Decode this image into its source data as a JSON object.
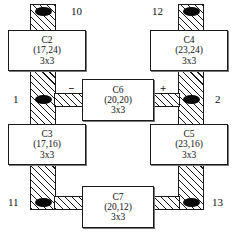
{
  "diagram": {
    "type": "floorplan-schematic",
    "colors": {
      "ink": "#1a1a1a",
      "paper": "#ffffff",
      "node": "#0a0a0a",
      "hatch": "#1a1a1a"
    },
    "cells": [
      {
        "id": "C2",
        "name": "C2",
        "coord": "(17,24)",
        "size": "3x3"
      },
      {
        "id": "C4",
        "name": "C4",
        "coord": "(23,24)",
        "size": "3x3"
      },
      {
        "id": "C6",
        "name": "C6",
        "coord": "(20,20)",
        "size": "3x3"
      },
      {
        "id": "C3",
        "name": "C3",
        "coord": "(17,16)",
        "size": "3x3"
      },
      {
        "id": "C5",
        "name": "C5",
        "coord": "(23,16)",
        "size": "3x3"
      },
      {
        "id": "C7",
        "name": "C7",
        "coord": "(20,12)",
        "size": "3x3"
      }
    ],
    "ports": [
      {
        "id": "p10",
        "label": "10",
        "position": "top-left"
      },
      {
        "id": "p12",
        "label": "12",
        "position": "top-right"
      },
      {
        "id": "p1",
        "label": "1",
        "position": "middle-left"
      },
      {
        "id": "p2",
        "label": "2",
        "position": "middle-right"
      },
      {
        "id": "p11",
        "label": "11",
        "position": "bottom-left"
      },
      {
        "id": "p13",
        "label": "13",
        "position": "bottom-right"
      }
    ],
    "signs": [
      {
        "id": "minus",
        "label": "−",
        "position": "left-of-C6"
      },
      {
        "id": "plus",
        "label": "+",
        "position": "right-of-C6"
      }
    ],
    "nodes": [
      {
        "id": "n-top-left",
        "near_port": "10"
      },
      {
        "id": "n-top-right",
        "near_port": "12"
      },
      {
        "id": "n-mid-left",
        "near_port": "1"
      },
      {
        "id": "n-mid-right",
        "near_port": "2"
      },
      {
        "id": "n-bottom-left",
        "near_port": "11"
      },
      {
        "id": "n-bottom-right",
        "near_port": "13"
      }
    ],
    "caption_fragment": ""
  }
}
